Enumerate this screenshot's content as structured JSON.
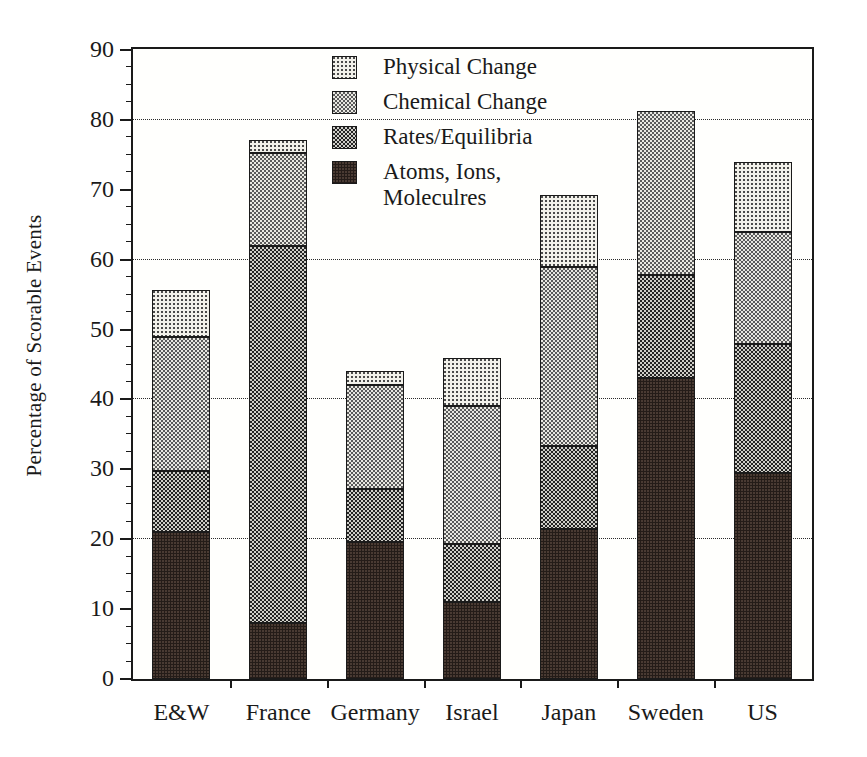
{
  "chart_data": {
    "type": "bar",
    "subtype": "stacked-bar",
    "title": "",
    "xlabel": "",
    "ylabel": "Percentage of Scorable Events",
    "ylim": [
      0,
      90
    ],
    "ytick_labels": [
      "0",
      "10",
      "20",
      "30",
      "40",
      "50",
      "60",
      "70",
      "80",
      "90"
    ],
    "ytick_values": [
      0,
      10,
      20,
      30,
      40,
      50,
      60,
      70,
      80,
      90
    ],
    "ytick_minor_step": 2.5,
    "gridlines_at": [
      20,
      40,
      60,
      80
    ],
    "grid": "horizontal-dotted",
    "legend_position": "top-center",
    "categories": [
      "E&W",
      "France",
      "Germany",
      "Israel",
      "Japan",
      "Sweden",
      "US"
    ],
    "series": [
      {
        "name": "Atoms, Ions,\nMoleculres",
        "legend_label": "Atoms, Ions,\nMoleculres",
        "pattern": "solid-black",
        "color": "#241c18",
        "values": [
          21.0,
          8.0,
          19.6,
          11.0,
          21.5,
          43.0,
          29.5
        ]
      },
      {
        "name": "Rates/Equilibria",
        "legend_label": "Rates/Equilibria",
        "pattern": "dark-checker",
        "color": "#4a4a4a",
        "values": [
          8.8,
          54.0,
          7.6,
          8.3,
          11.8,
          14.8,
          18.5
        ]
      },
      {
        "name": "Chemical Change",
        "legend_label": "Chemical Change",
        "pattern": "medium-checker",
        "color": "#b8b7b0",
        "values": [
          19.2,
          13.2,
          14.8,
          19.7,
          25.7,
          23.5,
          16.0
        ]
      },
      {
        "name": "Physical Change",
        "legend_label": "Physical Change",
        "pattern": "light-dot",
        "color": "#f2f1ea",
        "values": [
          6.7,
          1.9,
          2.1,
          7.0,
          10.3,
          0.0,
          10.0
        ]
      }
    ],
    "cumulative_tops": {
      "E&W": [
        21.0,
        29.8,
        49.0,
        55.7
      ],
      "France": [
        8.0,
        62.0,
        75.2,
        77.1
      ],
      "Germany": [
        19.6,
        27.2,
        42.0,
        44.1
      ],
      "Israel": [
        11.0,
        19.3,
        39.0,
        46.0
      ],
      "Japan": [
        21.5,
        33.3,
        59.0,
        69.3
      ],
      "Sweden": [
        43.0,
        57.8,
        81.3,
        81.3
      ],
      "US": [
        29.5,
        48.0,
        64.0,
        74.0
      ]
    },
    "totals": [
      55.7,
      77.1,
      44.1,
      46.0,
      69.3,
      81.3,
      74.0
    ]
  },
  "legend": {
    "items": [
      {
        "label": "Physical Change",
        "pattern": "light-dot"
      },
      {
        "label": "Chemical Change",
        "pattern": "medium-checker"
      },
      {
        "label": "Rates/Equilibria",
        "pattern": "dark-checker"
      },
      {
        "label": "Atoms, Ions,\nMoleculres",
        "pattern": "solid-black"
      }
    ]
  },
  "axis": {
    "y_title": "Percentage of Scorable Events"
  },
  "colors": {
    "axis": "#1a1a1a",
    "grid": "#2b2b2b",
    "background": "#ffffff",
    "plot_background": "#fffffd"
  }
}
